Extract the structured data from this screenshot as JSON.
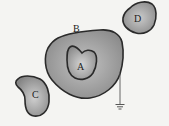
{
  "diagram": {
    "type": "electrostatic-conductors",
    "labels": {
      "a": "A",
      "b": "B",
      "c": "C",
      "d": "D"
    },
    "colors": {
      "background": "#f4f4f2",
      "outline": "#2a2a2a",
      "fill_light": "#c8c8c8",
      "fill_dark": "#7a7a7a"
    },
    "elements": [
      {
        "id": "A",
        "description": "inner conductor inside cavity of B"
      },
      {
        "id": "B",
        "description": "large hollow conductor, grounded"
      },
      {
        "id": "C",
        "description": "separate conductor, lower left"
      },
      {
        "id": "D",
        "description": "separate conductor, upper right"
      },
      {
        "id": "ground",
        "description": "ground symbol connected to B"
      }
    ]
  }
}
